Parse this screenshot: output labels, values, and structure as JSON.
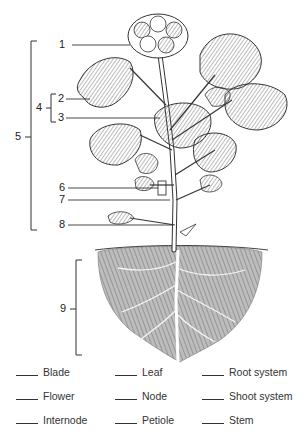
{
  "diagram": {
    "callouts": [
      {
        "number": "1",
        "target": "flower cluster"
      },
      {
        "number": "2",
        "target": "leaf blade"
      },
      {
        "number": "3",
        "target": "petiole"
      },
      {
        "number": "4",
        "target": "leaf (bracket spanning 2 and 3)"
      },
      {
        "number": "5",
        "target": "shoot system (bracket spanning 1 to 8)"
      },
      {
        "number": "6",
        "target": "node (boxed region on stem)"
      },
      {
        "number": "7",
        "target": "internode"
      },
      {
        "number": "8",
        "target": "stem"
      },
      {
        "number": "9",
        "target": "root system (bracket)"
      }
    ]
  },
  "word_bank": {
    "columns": [
      [
        "Blade",
        "Flower",
        "Internode"
      ],
      [
        "Leaf",
        "Node",
        "Petiole"
      ],
      [
        "Root system",
        "Shoot system",
        "Stem"
      ]
    ]
  }
}
